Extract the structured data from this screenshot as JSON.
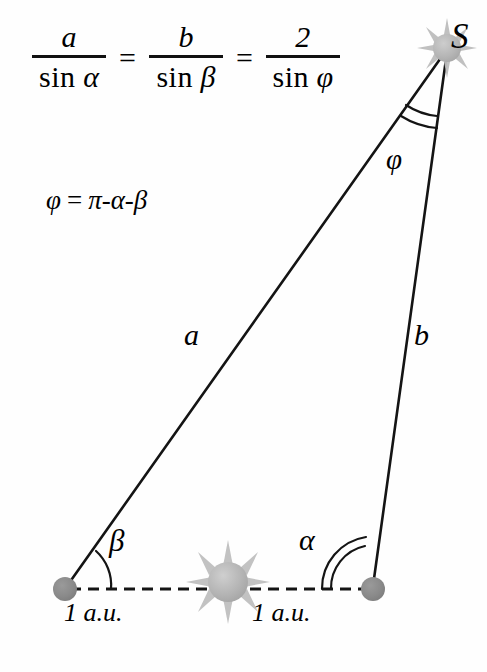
{
  "figure": {
    "type": "geometry-diagram",
    "background_color": "#fefefe",
    "stroke_color": "#111111",
    "planet_color": "#8c8c8c",
    "sun_color": "#b0b0b0"
  },
  "formula": {
    "law_of_sines": {
      "fractions": [
        {
          "numerator": "a",
          "denominator_fn": "sin",
          "denominator_arg": "α"
        },
        {
          "numerator": "b",
          "denominator_fn": "sin",
          "denominator_arg": "β"
        },
        {
          "numerator": "2",
          "denominator_fn": "sin",
          "denominator_arg": "φ"
        }
      ],
      "equals": "=",
      "plain_text": "a / sin α = b / sin β = 2 / sin φ"
    },
    "phi_identity": {
      "lhs": "φ",
      "equals": "=",
      "rhs": "π-α-β",
      "plain_text": "φ = π-α-β"
    }
  },
  "diagram": {
    "vertices": [
      {
        "name": "star-apex",
        "label": "S",
        "x": 447,
        "y": 48,
        "marker": "sun-burst"
      },
      {
        "name": "earth-position-1",
        "label": "",
        "x": 65,
        "y": 589,
        "marker": "planet-dot"
      },
      {
        "name": "earth-position-2",
        "label": "",
        "x": 373,
        "y": 589,
        "marker": "planet-dot"
      }
    ],
    "center_body": {
      "name": "sun",
      "label": "",
      "x": 228,
      "y": 582,
      "marker": "sun-burst"
    },
    "sides": [
      {
        "name": "side-a",
        "label": "a",
        "from": "earth-position-1",
        "to": "star-apex",
        "style": "solid"
      },
      {
        "name": "side-b",
        "label": "b",
        "from": "earth-position-2",
        "to": "star-apex",
        "style": "solid"
      },
      {
        "name": "baseline",
        "label": "2 a.u.",
        "from": "earth-position-1",
        "to": "earth-position-2",
        "style": "dashed"
      }
    ],
    "angles": [
      {
        "name": "angle-phi",
        "label": "φ",
        "at": "star-apex",
        "arcs": 2
      },
      {
        "name": "angle-beta",
        "label": "β",
        "at": "earth-position-1",
        "arcs": 1
      },
      {
        "name": "angle-alpha",
        "label": "α",
        "at": "earth-position-2",
        "arcs": 2
      }
    ],
    "distance_labels": [
      {
        "name": "au-left",
        "text": "1 a.u."
      },
      {
        "name": "au-right",
        "text": "1 a.u."
      }
    ]
  }
}
